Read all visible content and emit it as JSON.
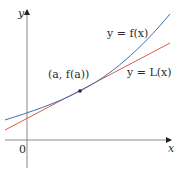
{
  "figure": {
    "type": "linear-approximation-diagram",
    "axes": {
      "x_label": "x",
      "y_label": "y",
      "origin_label": "0"
    },
    "curves": [
      {
        "name": "f",
        "label": "y = f(x)",
        "color": "#3b6fb6"
      },
      {
        "name": "L",
        "label": "y = L(x)",
        "color": "#e05a4a"
      }
    ],
    "point": {
      "label": "(a, f(a))",
      "color": "#1a2a4a"
    },
    "colors": {
      "axis": "#8a8a8a",
      "text": "#2a2a2a",
      "background": "#ffffff"
    }
  }
}
